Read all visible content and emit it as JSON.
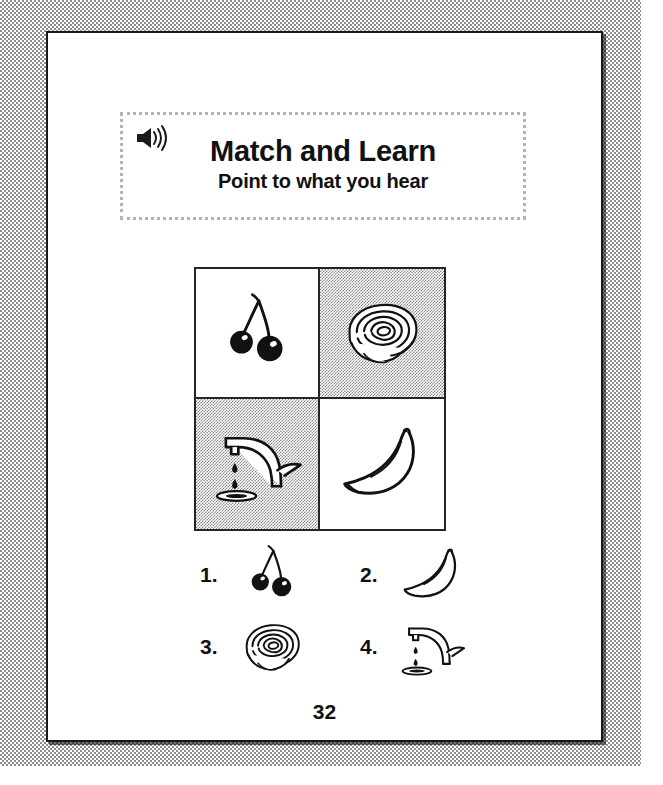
{
  "worksheet": {
    "page_number": "32",
    "header": {
      "icon": "speaker-audio-icon",
      "title": "Match and Learn",
      "subtitle": "Point to what you hear"
    },
    "grid": {
      "label": "picture-choice-grid",
      "cells": [
        {
          "position": "top-left",
          "picture": "cherries",
          "shaded": false
        },
        {
          "position": "top-right",
          "picture": "rose",
          "shaded": true
        },
        {
          "position": "bottom-left",
          "picture": "faucet",
          "shaded": true
        },
        {
          "position": "bottom-right",
          "picture": "banana",
          "shaded": false
        }
      ]
    },
    "options": [
      {
        "number": "1.",
        "picture": "cherries"
      },
      {
        "number": "2.",
        "picture": "banana"
      },
      {
        "number": "3.",
        "picture": "rose"
      },
      {
        "number": "4.",
        "picture": "faucet"
      }
    ],
    "colors": {
      "ink": "#111111",
      "rule": "#252525",
      "shade": "#8a8a8a",
      "dotted_border": "#b4b4b4",
      "paper": "#ffffff"
    }
  }
}
